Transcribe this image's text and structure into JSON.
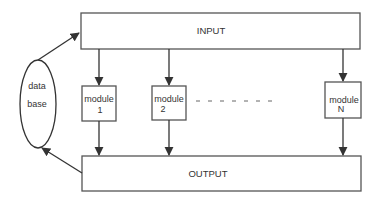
{
  "diagram": {
    "input": {
      "label": "INPUT"
    },
    "output": {
      "label": "OUTPUT"
    },
    "database": {
      "line1": "data",
      "line2": "base"
    },
    "modules": [
      {
        "line1": "module",
        "line2": "1"
      },
      {
        "line1": "module",
        "line2": "2"
      },
      {
        "line1": "module",
        "line2": "N"
      }
    ],
    "ellipsis": "- - - - - - -",
    "colors": {
      "stroke": "#333333",
      "box_stroke": "#555555",
      "text": "#333333",
      "background": "#ffffff"
    }
  }
}
